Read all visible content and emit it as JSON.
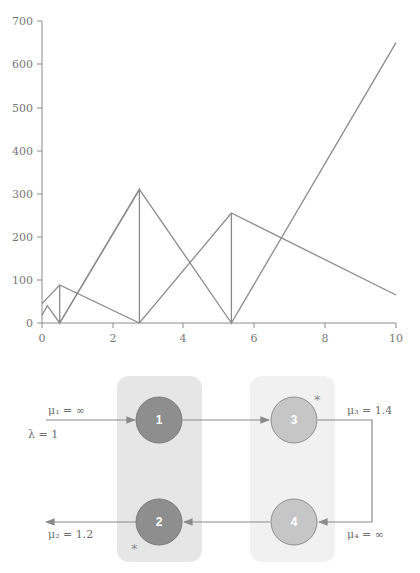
{
  "chart_data": {
    "type": "line",
    "title": "",
    "xlabel": "",
    "ylabel": "",
    "xlim": [
      0,
      10
    ],
    "ylim": [
      0,
      700
    ],
    "grid": false,
    "legend": null,
    "x_ticks": [
      "0",
      "2",
      "4",
      "6",
      "8",
      "10"
    ],
    "y_ticks": [
      "0",
      "100",
      "200",
      "300",
      "400",
      "500",
      "600",
      "700"
    ],
    "series": [
      {
        "name": "zigzag-small",
        "color": "#8a8a8a",
        "points": [
          [
            0,
            18
          ],
          [
            0.15,
            40
          ],
          [
            0.5,
            0
          ]
        ]
      },
      {
        "name": "line-a",
        "color": "#8a8a8a",
        "points": [
          [
            0,
            45
          ],
          [
            0.5,
            88
          ],
          [
            2.75,
            0
          ],
          [
            5.35,
            255
          ],
          [
            10,
            65
          ]
        ]
      },
      {
        "name": "line-b",
        "color": "#8a8a8a",
        "points": [
          [
            0.5,
            88
          ],
          [
            0.5,
            0
          ],
          [
            2.75,
            310
          ],
          [
            2.75,
            0
          ]
        ]
      },
      {
        "name": "line-c",
        "color": "#8a8a8a",
        "points": [
          [
            2.75,
            310
          ],
          [
            5.35,
            0
          ],
          [
            5.35,
            255
          ]
        ]
      },
      {
        "name": "line-steep",
        "color": "#8a8a8a",
        "points": [
          [
            5.35,
            0
          ],
          [
            10,
            650
          ]
        ]
      },
      {
        "name": "line-d",
        "color": "#8a8a8a",
        "points": [
          [
            0.5,
            0
          ],
          [
            2.75,
            310
          ]
        ]
      }
    ]
  },
  "diagram": {
    "groups": [
      {
        "id": "group-left",
        "fill": "#e6e6e6"
      },
      {
        "id": "group-right",
        "fill": "#f1f1f1"
      }
    ],
    "nodes": [
      {
        "id": "1",
        "label": "1",
        "fill": "#8e8e8e"
      },
      {
        "id": "2",
        "label": "2",
        "fill": "#8e8e8e"
      },
      {
        "id": "3",
        "label": "3",
        "fill": "#c6c6c6"
      },
      {
        "id": "4",
        "label": "4",
        "fill": "#c6c6c6"
      }
    ],
    "labels": {
      "mu1": "μ₁ = ∞",
      "lambda": "λ = 1",
      "mu2": "μ₂ = 1.2",
      "mu3": "μ₃ = 1.4",
      "mu4": "μ₄ = ∞",
      "star": "*"
    }
  }
}
